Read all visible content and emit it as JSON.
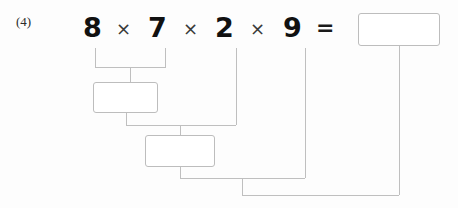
{
  "page": {
    "background_color": "#fdfdfd",
    "line_color": "#bfbfbf",
    "box_border_color": "#bdbdbd",
    "digit_color": "#111111",
    "operator_color": "#3a3a3a"
  },
  "problem": {
    "label": "(4)",
    "expression_text": "8 × 7 × 2 × 9 =",
    "terms": [
      {
        "value": "8",
        "x": 83
      },
      {
        "value": "7",
        "x": 148
      },
      {
        "value": "2",
        "x": 215
      },
      {
        "value": "9",
        "x": 283
      }
    ],
    "operators": [
      {
        "symbol": "×",
        "x": 116
      },
      {
        "symbol": "×",
        "x": 183
      },
      {
        "symbol": "×",
        "x": 250
      }
    ],
    "equals": {
      "symbol": "=",
      "x": 316
    }
  },
  "answer_boxes": [
    {
      "name": "partial-product-box-1",
      "value": "",
      "placeholder": "",
      "x": 93,
      "y": 82,
      "width": 65,
      "height": 31
    },
    {
      "name": "partial-product-box-2",
      "value": "",
      "placeholder": "",
      "x": 145,
      "y": 135,
      "width": 70,
      "height": 32
    },
    {
      "name": "final-answer-box",
      "value": "",
      "placeholder": "",
      "x": 358,
      "y": 13,
      "width": 82,
      "height": 33
    }
  ],
  "connector_paths": [
    {
      "name": "bracket-8-7",
      "d": "M95 48 L95 67 L165 67 L165 48"
    },
    {
      "name": "stem-bracket-to-box1",
      "d": "M130 67 L130 82"
    },
    {
      "name": "stem-box1-down",
      "d": "M126 113 L126 125"
    },
    {
      "name": "line-from-2",
      "d": "M236 48 L236 125"
    },
    {
      "name": "merge-box1-and-2",
      "d": "M126 125 L236 125"
    },
    {
      "name": "stem-merge-to-box2",
      "d": "M180 125 L180 135"
    },
    {
      "name": "stem-box2-down",
      "d": "M180 167 L180 178"
    },
    {
      "name": "line-from-9",
      "d": "M305 48 L305 178"
    },
    {
      "name": "merge-box2-and-9",
      "d": "M180 178 L305 178"
    },
    {
      "name": "stem-merge-to-final",
      "d": "M242 178 L242 195"
    },
    {
      "name": "line-from-final-box",
      "d": "M399 46 L399 195"
    },
    {
      "name": "merge-to-final-answer",
      "d": "M242 195 L399 195"
    }
  ]
}
